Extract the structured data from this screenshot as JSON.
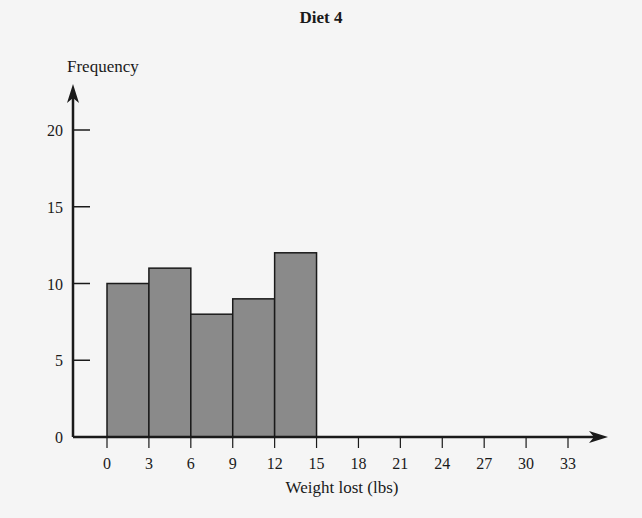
{
  "chart_data": {
    "type": "bar",
    "title": "Diet 4",
    "xlabel": "Weight lost (lbs)",
    "ylabel": "Frequency",
    "bin_edges": [
      0,
      3,
      6,
      9,
      12,
      15
    ],
    "categories": [
      "0-3",
      "3-6",
      "6-9",
      "9-12",
      "12-15"
    ],
    "values": [
      10,
      11,
      8,
      9,
      12
    ],
    "x_ticks": [
      0,
      3,
      6,
      9,
      12,
      15,
      18,
      21,
      24,
      27,
      30,
      33
    ],
    "y_ticks": [
      0,
      5,
      10,
      15,
      20
    ],
    "xlim": [
      0,
      35
    ],
    "ylim": [
      0,
      22
    ],
    "grid": false,
    "bar_color": "#8a8a8a",
    "edge_color": "#1a1a1a"
  },
  "labels": {
    "title": "Diet 4",
    "xlabel": "Weight lost (lbs)",
    "ylabel": "Frequency"
  }
}
